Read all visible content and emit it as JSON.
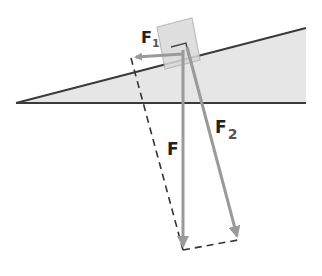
{
  "diagram": {
    "colors": {
      "incline_fill": "#e6e6e6",
      "incline_line": "#3a3a3a",
      "block_fill": "#d9d9d9",
      "block_edge": "#b0b0b0",
      "force_arrow": "#9a9a9a",
      "dashed_line": "#333333",
      "label": "#222222"
    },
    "labels": {
      "f1_main": "F",
      "f1_sub": "1",
      "f_main": "F",
      "f2_main": "F",
      "f2_sub": "2"
    },
    "elements": [
      {
        "name": "inclined-plane",
        "type": "triangle"
      },
      {
        "name": "block",
        "type": "rotated-square"
      },
      {
        "name": "force-F",
        "direction": "vertical-down",
        "meaning": "weight"
      },
      {
        "name": "force-F1",
        "direction": "parallel-to-incline",
        "meaning": "component along incline"
      },
      {
        "name": "force-F2",
        "direction": "perpendicular-to-incline",
        "meaning": "component into incline"
      },
      {
        "name": "parallelogram-construction",
        "style": "dashed"
      }
    ]
  }
}
